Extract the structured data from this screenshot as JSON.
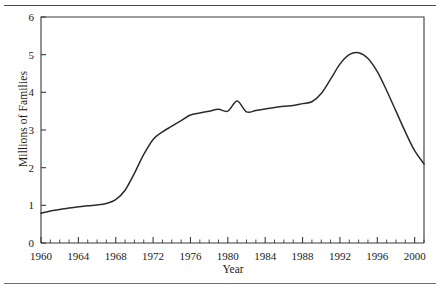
{
  "figure": {
    "has_top_rule": true,
    "has_bottom_rule": true,
    "background": "#ffffff",
    "line_color": "#2b2b2b",
    "axis_color": "#3a3a3a"
  },
  "chart_data": {
    "type": "line",
    "title": "",
    "xlabel": "Year",
    "ylabel": "Millions of Families",
    "xlim": [
      1960,
      2001
    ],
    "ylim": [
      0,
      6
    ],
    "grid": false,
    "legend": null,
    "y_ticks": [
      "0",
      "1",
      "2",
      "3",
      "4",
      "5",
      "6"
    ],
    "y_tick_values": [
      0,
      1,
      2,
      3,
      4,
      5,
      6
    ],
    "x_ticks": [
      "1960",
      "1964",
      "1968",
      "1972",
      "1976",
      "1980",
      "1984",
      "1988",
      "1992",
      "1996",
      "2000"
    ],
    "x_tick_values": [
      1960,
      1964,
      1968,
      1972,
      1976,
      1980,
      1984,
      1988,
      1992,
      1996,
      2000
    ],
    "x_minor_tick_interval": 1,
    "series": [
      {
        "name": "Families",
        "x": [
          1960,
          1961,
          1962,
          1963,
          1964,
          1965,
          1966,
          1967,
          1968,
          1969,
          1970,
          1971,
          1972,
          1973,
          1974,
          1975,
          1976,
          1977,
          1978,
          1979,
          1980,
          1981,
          1982,
          1983,
          1984,
          1985,
          1986,
          1987,
          1988,
          1989,
          1990,
          1991,
          1992,
          1993,
          1994,
          1995,
          1996,
          1997,
          1998,
          1999,
          2000,
          2001
        ],
        "values": [
          0.79,
          0.85,
          0.89,
          0.93,
          0.96,
          0.99,
          1.01,
          1.05,
          1.15,
          1.4,
          1.85,
          2.35,
          2.75,
          2.95,
          3.1,
          3.25,
          3.4,
          3.45,
          3.5,
          3.55,
          3.5,
          3.77,
          3.48,
          3.52,
          3.56,
          3.6,
          3.63,
          3.65,
          3.7,
          3.75,
          3.97,
          4.35,
          4.75,
          5.0,
          5.05,
          4.9,
          4.55,
          4.05,
          3.5,
          2.95,
          2.45,
          2.1
        ]
      }
    ]
  }
}
